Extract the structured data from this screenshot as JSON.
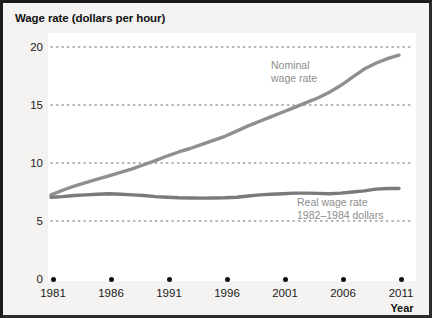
{
  "chart_data": {
    "type": "line",
    "title": "Wage rate (dollars per hour)",
    "xlabel": "Year",
    "ylabel": "Wage rate (dollars per hour)",
    "xlim": [
      1981,
      2011
    ],
    "ylim": [
      0,
      21
    ],
    "x_ticks": [
      1981,
      1986,
      1991,
      1996,
      2001,
      2006,
      2011
    ],
    "y_ticks": [
      0,
      5,
      10,
      15,
      20
    ],
    "grid": "horizontal-dotted",
    "legend": "inline-annotations",
    "x": [
      1981,
      1982,
      1983,
      1984,
      1985,
      1986,
      1987,
      1988,
      1989,
      1990,
      1991,
      1992,
      1993,
      1994,
      1995,
      1996,
      1997,
      1998,
      1999,
      2000,
      2001,
      2002,
      2003,
      2004,
      2005,
      2006,
      2007,
      2008,
      2009,
      2010,
      2011
    ],
    "series": [
      {
        "name": "Nominal wage rate",
        "color": "#8f8f8f",
        "values": [
          7.25,
          7.65,
          8.0,
          8.3,
          8.6,
          8.9,
          9.2,
          9.5,
          9.85,
          10.2,
          10.6,
          10.95,
          11.25,
          11.6,
          11.95,
          12.3,
          12.75,
          13.2,
          13.6,
          14.0,
          14.4,
          14.8,
          15.2,
          15.6,
          16.1,
          16.7,
          17.4,
          18.1,
          18.6,
          19.0,
          19.3
        ]
      },
      {
        "name": "Real wage rate",
        "color": "#7a7a7a",
        "values": [
          7.05,
          7.1,
          7.2,
          7.25,
          7.3,
          7.35,
          7.3,
          7.25,
          7.2,
          7.1,
          7.05,
          7.0,
          6.98,
          6.97,
          6.98,
          7.0,
          7.05,
          7.15,
          7.25,
          7.3,
          7.35,
          7.4,
          7.4,
          7.38,
          7.35,
          7.4,
          7.5,
          7.6,
          7.75,
          7.8,
          7.8
        ]
      }
    ],
    "annotations": [
      {
        "name": "nominal-label",
        "line1": "Nominal",
        "line2": "wage rate",
        "x": 268,
        "y": 56
      },
      {
        "name": "real-label",
        "line1": "Real wage rate",
        "line2": "1982–1984 dollars",
        "x": 294,
        "y": 193
      }
    ]
  },
  "axis": {
    "y_tick_labels": [
      "20",
      "15",
      "10",
      "5",
      "0"
    ],
    "x_tick_labels": [
      "1981",
      "1986",
      "1991",
      "1996",
      "2001",
      "2006",
      "2011"
    ],
    "x_title": "Year"
  },
  "colors": {
    "nominal_line": "#8f8f8f",
    "real_line": "#7a7a7a",
    "grid_dot": "#9a9a9a",
    "text": "#1a1a1a",
    "label_text": "#8d8d8d",
    "plot_bg": "#ffffff",
    "figure_bg": "#f4f3f1",
    "frame": "#1c1c1c"
  }
}
